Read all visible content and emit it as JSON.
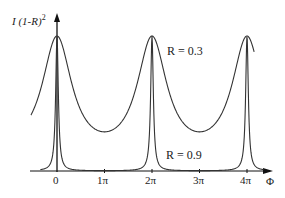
{
  "chart_data": {
    "type": "line",
    "title": "",
    "ylabel": "I (1-R)^2",
    "xlabel": "Φ",
    "x_ticks": [
      "0",
      "1π",
      "2π",
      "3π",
      "4π"
    ],
    "x_range": [
      -0.4,
      4.6
    ],
    "grid": false,
    "series": [
      {
        "name": "R = 0.3",
        "description": "Airy transmission, broad peaks at 0, 2π, 4π, nonzero minima at π, 3π",
        "peak": 1.0,
        "min_fraction": 0.29
      },
      {
        "name": "R = 0.9",
        "description": "Airy transmission, sharp peaks at 0, 2π, 4π, near-zero between",
        "peak": 1.0,
        "min_fraction": 0.003
      }
    ],
    "annotations": [
      {
        "text": "R = 0.3",
        "near_x": "2π",
        "position": "right of peak, upper"
      },
      {
        "text": "R = 0.9",
        "near_x": "2π",
        "position": "right of peak, lower"
      }
    ]
  },
  "labels": {
    "y_axis": "I (1-R)",
    "y_axis_exp": "2",
    "x_axis": "Φ",
    "ticks": [
      "0",
      "1π",
      "2π",
      "3π",
      "4π"
    ],
    "r03": "R = 0.3",
    "r09": "R = 0.9"
  }
}
